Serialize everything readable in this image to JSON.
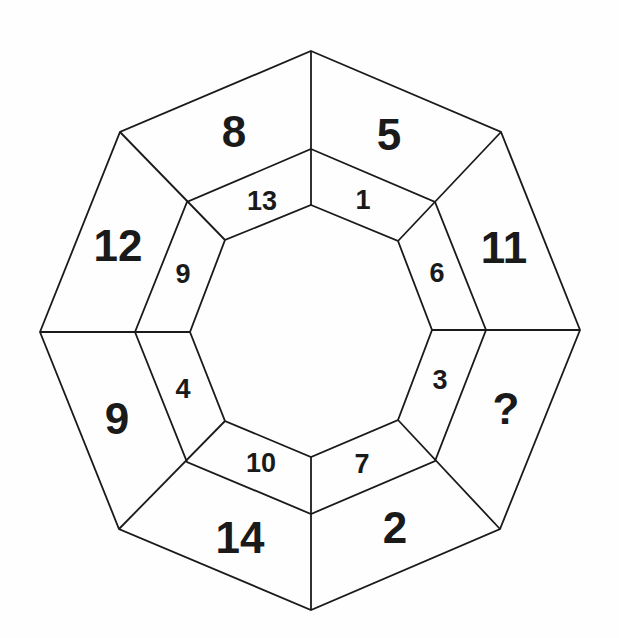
{
  "puzzle": {
    "shape": "octagon-ring",
    "outer_segments": [
      {
        "position": "top-left",
        "value": "8"
      },
      {
        "position": "top-right",
        "value": "5"
      },
      {
        "position": "right-upper",
        "value": "11"
      },
      {
        "position": "right-lower",
        "value": "?"
      },
      {
        "position": "bottom-right",
        "value": "2"
      },
      {
        "position": "bottom-left",
        "value": "14"
      },
      {
        "position": "left-lower",
        "value": "9"
      },
      {
        "position": "left-upper",
        "value": "12"
      }
    ],
    "inner_segments": [
      {
        "position": "top-left",
        "value": "13"
      },
      {
        "position": "top-right",
        "value": "1"
      },
      {
        "position": "right-upper",
        "value": "6"
      },
      {
        "position": "right-lower",
        "value": "3"
      },
      {
        "position": "bottom-right",
        "value": "7"
      },
      {
        "position": "bottom-left",
        "value": "10"
      },
      {
        "position": "left-lower",
        "value": "4"
      },
      {
        "position": "left-upper",
        "value": "9"
      }
    ],
    "colors": {
      "line": "#1a1a1a",
      "background": "#fefefe"
    }
  }
}
